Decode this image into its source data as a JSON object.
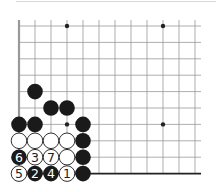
{
  "board": {
    "cols": 12,
    "rows": 10,
    "origin_x": 19,
    "origin_y": 26,
    "dx": 16,
    "dy": 16.4,
    "edges": [
      "left",
      "bottom"
    ],
    "star_points": [
      [
        3,
        0
      ],
      [
        9,
        0
      ],
      [
        3,
        6
      ],
      [
        9,
        6
      ]
    ],
    "stones": [
      {
        "col": 1,
        "row": 4,
        "color": "black",
        "label": ""
      },
      {
        "col": 2,
        "row": 5,
        "color": "black",
        "label": ""
      },
      {
        "col": 3,
        "row": 5,
        "color": "black",
        "label": ""
      },
      {
        "col": 0,
        "row": 6,
        "color": "black",
        "label": ""
      },
      {
        "col": 1,
        "row": 6,
        "color": "black",
        "label": ""
      },
      {
        "col": 4,
        "row": 6,
        "color": "black",
        "label": ""
      },
      {
        "col": 0,
        "row": 7,
        "color": "white",
        "label": ""
      },
      {
        "col": 1,
        "row": 7,
        "color": "white",
        "label": ""
      },
      {
        "col": 2,
        "row": 7,
        "color": "white",
        "label": ""
      },
      {
        "col": 3,
        "row": 7,
        "color": "white",
        "label": ""
      },
      {
        "col": 4,
        "row": 7,
        "color": "black",
        "label": ""
      },
      {
        "col": 0,
        "row": 8,
        "color": "black",
        "label": "6"
      },
      {
        "col": 1,
        "row": 8,
        "color": "white",
        "label": "3"
      },
      {
        "col": 2,
        "row": 8,
        "color": "white",
        "label": "7"
      },
      {
        "col": 3,
        "row": 8,
        "color": "white",
        "label": ""
      },
      {
        "col": 4,
        "row": 8,
        "color": "black",
        "label": ""
      },
      {
        "col": 0,
        "row": 9,
        "color": "white",
        "label": "5"
      },
      {
        "col": 1,
        "row": 9,
        "color": "black",
        "label": "2"
      },
      {
        "col": 2,
        "row": 9,
        "color": "black",
        "label": "4"
      },
      {
        "col": 3,
        "row": 9,
        "color": "white",
        "label": "1"
      },
      {
        "col": 4,
        "row": 9,
        "color": "black",
        "label": ""
      }
    ]
  }
}
